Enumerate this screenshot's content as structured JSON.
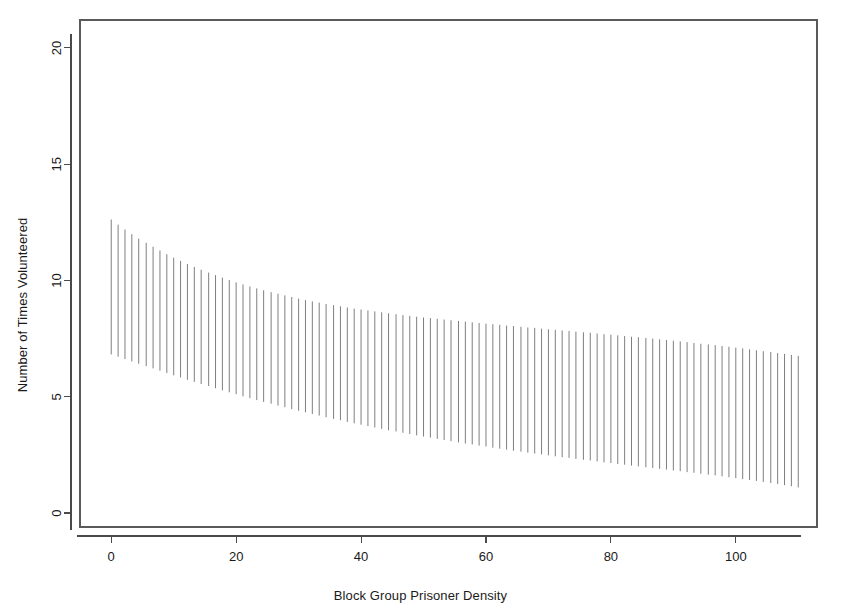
{
  "chart_data": {
    "type": "bar",
    "title": "",
    "subtitle": "",
    "xlabel": "Block Group Prisoner Density",
    "ylabel": "Number of Times Volunteered",
    "xlim": [
      -5,
      113
    ],
    "ylim": [
      -0.6,
      21.2
    ],
    "xticks": [
      0,
      20,
      40,
      60,
      80,
      100
    ],
    "xtick_labels": [
      "0",
      "20",
      "40",
      "60",
      "80",
      "100"
    ],
    "yticks": [
      0,
      5,
      10,
      15,
      20
    ],
    "ytick_labels": [
      "0",
      "5",
      "10",
      "15",
      "20"
    ],
    "grid": false,
    "legend": null,
    "annotations": [],
    "n_points": 100,
    "series": [
      {
        "name": "upper_bound",
        "values": [
          12.62,
          12.4,
          12.19,
          11.99,
          11.8,
          11.62,
          11.45,
          11.29,
          11.13,
          10.98,
          10.84,
          10.71,
          10.58,
          10.46,
          10.34,
          10.23,
          10.12,
          10.02,
          9.92,
          9.83,
          9.74,
          9.66,
          9.58,
          9.5,
          9.43,
          9.36,
          9.29,
          9.22,
          9.16,
          9.1,
          9.05,
          8.99,
          8.94,
          8.89,
          8.84,
          8.79,
          8.75,
          8.71,
          8.67,
          8.63,
          8.59,
          8.55,
          8.51,
          8.48,
          8.44,
          8.41,
          8.38,
          8.35,
          8.32,
          8.29,
          8.26,
          8.23,
          8.2,
          8.17,
          8.14,
          8.12,
          8.09,
          8.06,
          8.04,
          8.01,
          7.98,
          7.96,
          7.93,
          7.9,
          7.88,
          7.85,
          7.83,
          7.8,
          7.77,
          7.75,
          7.72,
          7.69,
          7.67,
          7.64,
          7.61,
          7.58,
          7.56,
          7.53,
          7.5,
          7.47,
          7.44,
          7.41,
          7.38,
          7.35,
          7.31,
          7.28,
          7.25,
          7.22,
          7.18,
          7.15,
          7.11,
          7.08,
          7.04,
          7.0,
          6.96,
          6.92,
          6.88,
          6.84,
          6.8,
          6.76
        ]
      },
      {
        "name": "lower_bound",
        "values": [
          6.82,
          6.72,
          6.62,
          6.52,
          6.42,
          6.32,
          6.22,
          6.12,
          6.02,
          5.92,
          5.83,
          5.73,
          5.64,
          5.55,
          5.46,
          5.37,
          5.28,
          5.19,
          5.11,
          5.02,
          4.94,
          4.86,
          4.78,
          4.7,
          4.62,
          4.55,
          4.47,
          4.4,
          4.33,
          4.26,
          4.19,
          4.12,
          4.05,
          3.99,
          3.92,
          3.86,
          3.8,
          3.74,
          3.68,
          3.62,
          3.56,
          3.51,
          3.45,
          3.4,
          3.34,
          3.29,
          3.24,
          3.19,
          3.14,
          3.09,
          3.04,
          2.99,
          2.95,
          2.9,
          2.86,
          2.81,
          2.77,
          2.73,
          2.68,
          2.64,
          2.6,
          2.56,
          2.52,
          2.48,
          2.44,
          2.4,
          2.37,
          2.33,
          2.29,
          2.26,
          2.22,
          2.18,
          2.15,
          2.11,
          2.08,
          2.04,
          2.01,
          1.97,
          1.94,
          1.9,
          1.87,
          1.83,
          1.8,
          1.76,
          1.73,
          1.69,
          1.65,
          1.62,
          1.58,
          1.54,
          1.5,
          1.46,
          1.42,
          1.38,
          1.34,
          1.29,
          1.25,
          1.2,
          1.15,
          1.1
        ]
      }
    ],
    "x": [
      0.0,
      1.1,
      2.2,
      3.3,
      4.4,
      5.6,
      6.7,
      7.8,
      8.9,
      10.0,
      11.1,
      12.2,
      13.3,
      14.4,
      15.6,
      16.7,
      17.8,
      18.9,
      20.0,
      21.1,
      22.2,
      23.3,
      24.4,
      25.6,
      26.7,
      27.8,
      28.9,
      30.0,
      31.1,
      32.2,
      33.3,
      34.4,
      35.6,
      36.7,
      37.8,
      38.9,
      40.0,
      41.1,
      42.2,
      43.3,
      44.4,
      45.6,
      46.7,
      47.8,
      48.9,
      50.0,
      51.1,
      52.2,
      53.3,
      54.4,
      55.6,
      56.7,
      57.8,
      58.9,
      60.0,
      61.1,
      62.2,
      63.3,
      64.4,
      65.6,
      66.7,
      67.8,
      68.9,
      70.0,
      71.1,
      72.2,
      73.3,
      74.4,
      75.6,
      76.7,
      77.8,
      78.9,
      80.0,
      81.1,
      82.2,
      83.3,
      84.4,
      85.6,
      86.7,
      87.8,
      88.9,
      90.0,
      91.1,
      92.2,
      93.3,
      94.4,
      95.6,
      96.7,
      97.8,
      98.9,
      100.0,
      101.1,
      102.2,
      103.3,
      104.4,
      105.6,
      106.7,
      107.8,
      108.9,
      110.0
    ]
  },
  "colors": {
    "background": "#ffffff",
    "line": "#707070",
    "axis": "#4a4a4a",
    "text": "#1a1a1a"
  }
}
